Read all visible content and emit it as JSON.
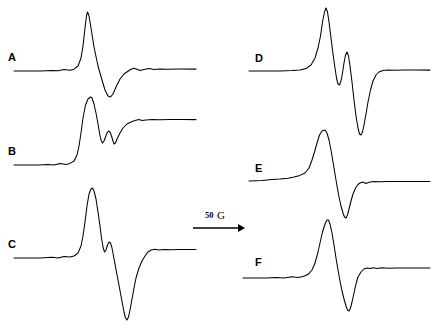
{
  "figure": {
    "kind": "epr-derivative-spectra-panel",
    "background_color": "#ffffff",
    "trace_color": "#000000",
    "width": 443,
    "height": 331,
    "column_count": 2,
    "panel_count": 6
  },
  "scale_bar": {
    "value": "50",
    "unit": "G",
    "full_label": "50 G",
    "direction": "right",
    "x_start": 193,
    "x_end": 243,
    "y": 228,
    "label_x": 205,
    "label_y": 218
  },
  "panels": [
    {
      "id": "A",
      "label": "A",
      "column": "left",
      "label_x": 8,
      "label_y": 61,
      "baseline_y": 71,
      "x_start": 14,
      "x_end": 196,
      "peak_x": 87,
      "peak_y": 12,
      "trough_x": 110,
      "trough_y": 97
    },
    {
      "id": "B",
      "label": "B",
      "column": "left",
      "label_x": 8,
      "label_y": 155,
      "baseline_y": 165,
      "x_start": 14,
      "x_end": 196,
      "peak_x": 91,
      "peak_y": 97,
      "trough_x": 114,
      "trough_y": 124
    },
    {
      "id": "C",
      "label": "C",
      "column": "left",
      "label_x": 8,
      "label_y": 248,
      "baseline_y": 258,
      "x_start": 14,
      "x_end": 196,
      "peak_x": 92,
      "peak_y": 188,
      "trough_x": 112,
      "trough_y": 320
    },
    {
      "id": "D",
      "label": "D",
      "column": "right",
      "label_x": 255,
      "label_y": 62,
      "baseline_y": 71,
      "x_start": 249,
      "x_end": 430,
      "peak_x": 326,
      "peak_y": 8,
      "trough_x": 352,
      "trough_y": 135
    },
    {
      "id": "E",
      "label": "E",
      "column": "right",
      "label_x": 255,
      "label_y": 172,
      "baseline_y": 181,
      "x_start": 249,
      "x_end": 430,
      "peak_x": 326,
      "peak_y": 130
    },
    {
      "id": "F",
      "label": "F",
      "column": "right",
      "label_x": 255,
      "label_y": 266,
      "baseline_y": 278,
      "x_start": 243,
      "x_end": 430,
      "peak_x": 328,
      "peak_y": 220
    }
  ],
  "traces": {
    "A": "M14,71 L40,71 L52,70.4 L58,70.8 L64,69.6 L70,70.2 L74,69.2 L78,66 L81,58 L83,46 L85,28 L86.6,15 L87.6,12 L89,16 L91,28 L94,47 L98,66 L102,80 L105,90 L108,96 L110.5,97 L113,94 L116,87 L120,79 L124,74 L128,71.2 L131,69.2 L134,68.2 L137,69.2 L140,70.6 L144,69.6 L149,68.6 L154,69.4 L160,69 L168,69.2 L178,69.1 L196,69.1",
    "B": "M14,165 L38,165 L48,164.4 L54,165 L60,163.6 L66,164.4 L70,163.4 L74,161 L77,155 L79,146 L81,133 L83,118 L85.5,105 L88,99 L90.5,97 L92,98 L94,104 L96,113 L98,124 L99.5,133 L101,140 L102.5,143 L104,141 L105.5,137 L107,133 L108.5,131 L110,132 L111.5,136 L113,141 L114,144 L115.5,143 L117.5,138 L120,133 L123,128 L127,124 L131,122 L135,120.5 L139,119.6 L142,120.4 L146,120 L152,119.4 L160,119.8 L170,119.5 L182,119.6 L196,119.6",
    "C": "M14,258 L40,258 L52,257.2 L58,258 L64,256.4 L70,257 L74,256 L78,253 L81,246 L83,236 L85,222 L87,206 L89,194 L91,189 L92.5,188 L94,191 L96,199 L98,212 L100,226 L101.5,238 L103,247 L104.5,252 L106,250 L107.5,245 L109,242 L110.5,243 L112,248 L113.5,256 L115,264 L116.5,272 L118,280 L119.5,288 L121,296 L122.5,304 L124,312 L125.5,318 L127,320 L128.5,317 L130,310 L132,299 L134,288 L136,278 L139,268 L142,261 L145,256 L148,252 L151,250 L155,249.2 L159,250 L164,249.4 L170,249.8 L178,249.4 L186,249.6 L196,249.5",
    "D": "M249,71 L280,71 L292,70.6 L300,70 L306,68.6 L311,65 L315,58 L318,48 L320.5,36 L322.5,22 L324.5,12 L326,8 L327.5,12 L329,22 L331,38 L333,54 L335,68 L336.5,78 L338,84 L339.5,85 L341,81 L342.5,73 L344,63 L345.5,55 L347,52 L348.5,56 L350,66 L352,82 L354,100 L356,116 L358,128 L359.5,134 L361,135 L362.5,132 L364,125 L366,114 L368,102 L370.5,90 L373,81 L376,75 L379,72 L383,70.5 L388,70 L395,70.2 L404,70 L415,70.1 L430,70.1",
    "E": "M249,181 L262,180.4 L272,179.6 L280,179 L288,178.2 L294,177 L300,175.4 L305,173 L309,168 L312,160 L314.5,152 L317,143 L319.5,135 L322,131 L325,130 L327,133 L329,140 L331,150 L333,162 L335,174 L337,186 L339,197 L341,206 L343,213 L344.5,217 L346,218 L347.5,215 L349,209 L351,201 L353,194 L355.5,188 L358,184.5 L360,183 L363,182 L366,183.4 L369,182.2 L374,181.6 L380,181.8 L388,181.4 L398,181.6 L410,181.4 L430,181.5",
    "F": "M243,278 L266,278 L276,277.4 L284,278 L292,276.8 L298,277.4 L303,276.6 L308,274.6 L312,270 L315,263 L317.5,254 L320,243 L322.5,232 L325,224 L327,220 L328.5,220 L330,224 L332,233 L334,245 L336,258 L338,270 L340,281 L342,291 L344,299 L346,306 L347.5,310 L349,311 L350.5,308 L352,302 L354,293 L356,284 L358,277 L361,272 L364,269 L367,268 L370,268.6 L373,267.8 L377,268.4 L382,267.8 L389,268.2 L398,267.9 L410,268 L430,268"
  }
}
